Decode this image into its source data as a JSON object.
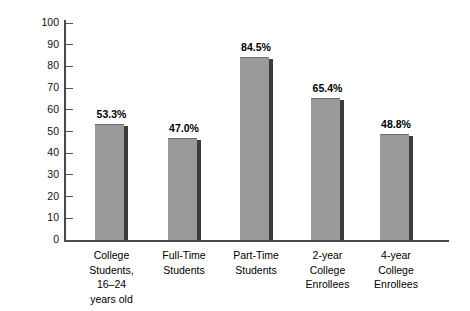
{
  "chart_data": {
    "type": "bar",
    "title": "",
    "subtitle": "",
    "xlabel": "",
    "ylabel": "Percent Employed",
    "ylim": [
      0,
      100
    ],
    "yticks": [
      0,
      10,
      20,
      30,
      40,
      50,
      60,
      70,
      80,
      90,
      100
    ],
    "ytick_labels": [
      "0",
      "10",
      "20",
      "30",
      "40",
      "50",
      "60",
      "70",
      "80",
      "90",
      "100"
    ],
    "grid": false,
    "legend": null,
    "categories": [
      "College\nStudents,\n16–24\nyears old",
      "Full-Time\nStudents",
      "Part-Time\nStudents",
      "2-year\nCollege\nEnrollees",
      "4-year\nCollege\nEnrollees"
    ],
    "values": [
      53.3,
      47.0,
      84.5,
      65.4,
      48.8
    ],
    "value_labels": [
      "53.3%",
      "47.0%",
      "84.5%",
      "65.4%",
      "48.8%"
    ],
    "colors": {
      "bar_fill": "#9a9a9a",
      "bar_shadow": "#3c3c3c",
      "axis": "#4a4a4a",
      "text": "#000000",
      "background": "#ffffff"
    }
  }
}
